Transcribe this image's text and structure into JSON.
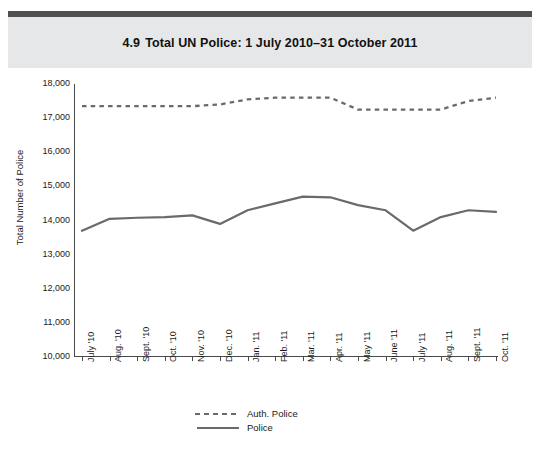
{
  "header": {
    "figure_number": "4.9",
    "title": "Total UN Police: 1 July 2010–31 October 2011",
    "band_color": "#e6e7e8",
    "rule_color": "#4f5052"
  },
  "chart_data": {
    "type": "line",
    "title": "Total UN Police: 1 July 2010–31 October 2011",
    "xlabel": "",
    "ylabel": "Total Number of Police",
    "categories": [
      "July '10",
      "Aug. '10",
      "Sept. '10",
      "Oct. '10",
      "Nov. '10",
      "Dec. '10",
      "Jan. '11",
      "Feb. '11",
      "Mar. '11",
      "Apr. '11",
      "May '11",
      "June '11",
      "July '11",
      "Aug. '11",
      "Sept. '11",
      "Oct. '11"
    ],
    "series": [
      {
        "name": "Auth. Police",
        "style": "dashed",
        "color": "#6a6a6a",
        "values": [
          17350,
          17350,
          17350,
          17350,
          17350,
          17400,
          17550,
          17600,
          17600,
          17600,
          17250,
          17250,
          17250,
          17250,
          17500,
          17600
        ]
      },
      {
        "name": "Police",
        "style": "solid",
        "color": "#6a6a6a",
        "values": [
          13700,
          14050,
          14080,
          14100,
          14150,
          13900,
          14300,
          14500,
          14700,
          14680,
          14450,
          14300,
          13700,
          14100,
          14300,
          14250
        ]
      }
    ],
    "ylim": [
      10000,
      18000
    ],
    "ytick_step": 1000,
    "yticks": [
      "18,000",
      "17,000",
      "16,000",
      "15,000",
      "14,000",
      "13,000",
      "12,000",
      "11,000",
      "10,000"
    ],
    "grid": false,
    "legend_position": "bottom-center"
  },
  "legend": {
    "items": [
      {
        "label": "Auth. Police",
        "style": "dashed"
      },
      {
        "label": "Police",
        "style": "solid"
      }
    ]
  }
}
